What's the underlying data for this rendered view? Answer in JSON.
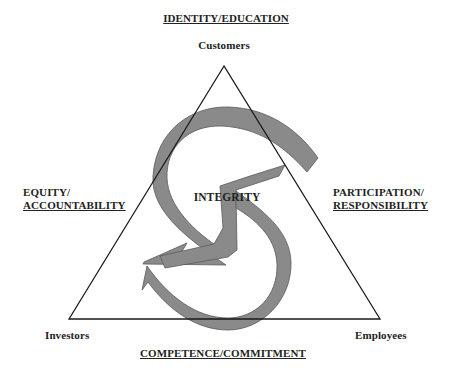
{
  "diagram": {
    "top_theme": "IDENTITY/EDUCATION",
    "left_theme": {
      "line1": "EQUITY/",
      "line2": "ACCOUNTABILITY"
    },
    "right_theme": {
      "line1": "PARTICIPATION/",
      "line2": "RESPONSIBILITY"
    },
    "bottom_theme": "COMPETENCE/COMMITMENT",
    "center_label": "INTEGRITY",
    "vertices": {
      "top": "Customers",
      "bottom_left": "Investors",
      "bottom_right": "Employees"
    },
    "colors": {
      "triangle_stroke": "#1a1a1a",
      "arrow_fill": "#8a8a8a",
      "arrow_stroke": "#5a5a5a",
      "text": "#222222"
    }
  }
}
